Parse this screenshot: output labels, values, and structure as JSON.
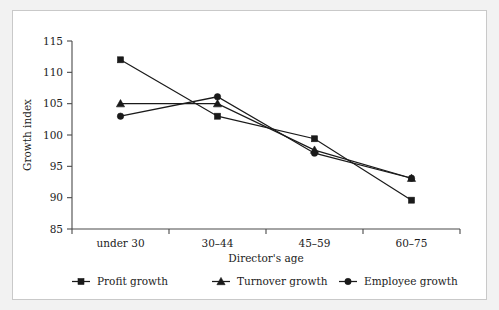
{
  "figure": {
    "background_color": "#ffffff",
    "frame_color": "#f2f2f2",
    "ink_color": "#1a1a1a"
  },
  "chart_data": {
    "type": "line",
    "title": "",
    "subtitle": "",
    "xlabel": "Director's age",
    "ylabel": "Growth index",
    "categories": [
      "under 30",
      "30–44",
      "45–59",
      "60–75"
    ],
    "ylim": [
      85,
      115
    ],
    "yticks": [
      85,
      90,
      95,
      100,
      105,
      110,
      115
    ],
    "ytick_labels": [
      "85",
      "90",
      "95",
      "100",
      "105",
      "110",
      "115"
    ],
    "grid": false,
    "legend_position": "below",
    "series": [
      {
        "name": "Profit growth",
        "marker": "square",
        "values": [
          112.0,
          103.0,
          99.4,
          89.6
        ]
      },
      {
        "name": "Turnover growth",
        "marker": "triangle",
        "values": [
          105.0,
          105.0,
          97.6,
          93.1
        ]
      },
      {
        "name": "Employee growth",
        "marker": "circle",
        "values": [
          103.0,
          106.1,
          97.1,
          93.1
        ]
      }
    ]
  },
  "legend": {
    "entries": [
      {
        "label": "Profit growth",
        "marker": "square"
      },
      {
        "label": "Turnover growth",
        "marker": "triangle"
      },
      {
        "label": "Employee growth",
        "marker": "circle"
      }
    ]
  }
}
